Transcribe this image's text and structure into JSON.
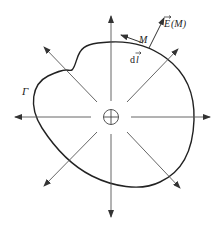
{
  "diagram": {
    "labels": {
      "contour": "Γ",
      "point": "M",
      "field": "E(M)",
      "field_vector_symbol": "E",
      "field_arg": "(M)",
      "line_element": "dl",
      "line_element_d": "d",
      "line_element_l": "l"
    },
    "center_symbol": "positive-charge",
    "field_line_count": 8,
    "colors": {
      "line": "#333333",
      "contour": "#222222",
      "arrow": "#333333"
    }
  }
}
